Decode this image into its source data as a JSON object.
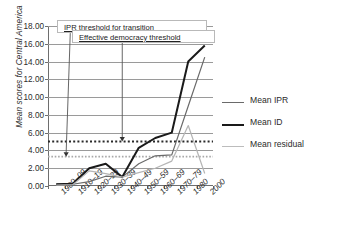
{
  "chart_data": {
    "type": "line",
    "title": "",
    "xlabel": "",
    "ylabel": "Mean scores for Central America",
    "ylim": [
      0,
      18
    ],
    "ytick_step": 2,
    "ytick_labels": [
      "0.00",
      "2.00",
      "4.00",
      "6.00",
      "8.00",
      "10.00",
      "12.00",
      "14.00",
      "16.00",
      "18.00"
    ],
    "grid": true,
    "legend_position": "right",
    "categories": [
      "1900–09",
      "1910–19",
      "1920–29",
      "1930–39",
      "1940–49",
      "1950–59",
      "1960–69",
      "1970–79",
      "1980",
      "2000"
    ],
    "series": [
      {
        "name": "Mean IPR",
        "color": "#6a6a6a",
        "width": 1.2,
        "values": [
          0.2,
          0.2,
          0.5,
          1.1,
          1.0,
          2.5,
          3.4,
          3.5,
          9.0,
          14.5
        ]
      },
      {
        "name": "Mean ID",
        "color": "#1a1a1a",
        "width": 2.0,
        "values": [
          0.2,
          0.25,
          2.0,
          2.5,
          1.0,
          4.3,
          5.4,
          6.0,
          14.0,
          15.8
        ]
      },
      {
        "name": "Mean residual",
        "color": "#b5b5b5",
        "width": 1.2,
        "values": [
          0.1,
          0.15,
          1.7,
          1.4,
          1.0,
          1.5,
          2.0,
          2.8,
          6.8,
          1.4
        ]
      }
    ],
    "threshold_lines": [
      {
        "name": "ipr-threshold-line",
        "value": 5.0,
        "color": "#2a2a2a",
        "style": "dotted",
        "width": 2.0
      },
      {
        "name": "effective-democracy-threshold-line",
        "value": 3.3,
        "color": "#a8a8a8",
        "style": "dotted",
        "width": 1.6
      }
    ],
    "annotations": [
      {
        "name": "ipr-threshold-annotation",
        "label": "IPR threshold for transition",
        "arrow_to_value": 3.3,
        "arrow_at_category_frac": 0.11
      },
      {
        "name": "effective-democracy-annotation",
        "label": "Effective democracy threshold",
        "arrow_to_value": 5.0,
        "arrow_at_category_frac": 0.45
      }
    ]
  },
  "legend": {
    "items": [
      {
        "label": "Mean IPR",
        "color": "#6a6a6a",
        "thickness": "1.4px"
      },
      {
        "label": "Mean ID",
        "color": "#1a1a1a",
        "thickness": "2.2px"
      },
      {
        "label": "Mean residual",
        "color": "#bcbcbc",
        "thickness": "1.4px"
      }
    ]
  }
}
